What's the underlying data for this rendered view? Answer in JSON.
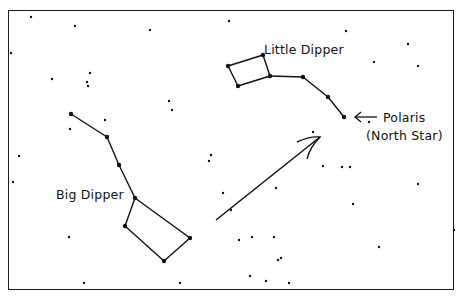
{
  "diagram": {
    "colors": {
      "ink": "#111111",
      "background": "#ffffff"
    },
    "labels": {
      "little_dipper": "Little Dipper",
      "big_dipper": "Big Dipper",
      "polaris": "Polaris",
      "north_star": "(North Star)"
    },
    "big_dipper": {
      "stars": [
        [
          71,
          114
        ],
        [
          107,
          137
        ],
        [
          119,
          165
        ],
        [
          135,
          198
        ],
        [
          125,
          226
        ],
        [
          164,
          261
        ],
        [
          190,
          238
        ]
      ],
      "lines": [
        [
          0,
          1
        ],
        [
          1,
          2
        ],
        [
          2,
          3
        ],
        [
          3,
          4
        ],
        [
          4,
          5
        ],
        [
          5,
          6
        ],
        [
          6,
          3
        ]
      ]
    },
    "little_dipper": {
      "stars": [
        [
          228,
          66
        ],
        [
          263,
          55
        ],
        [
          270,
          76
        ],
        [
          238,
          86
        ],
        [
          303,
          77
        ],
        [
          328,
          97
        ],
        [
          344,
          117
        ]
      ],
      "lines": [
        [
          0,
          1
        ],
        [
          1,
          2
        ],
        [
          2,
          3
        ],
        [
          3,
          0
        ],
        [
          2,
          4
        ],
        [
          4,
          5
        ],
        [
          5,
          6
        ]
      ]
    },
    "pointer_arrow": {
      "from": [
        216,
        220
      ],
      "to": [
        320,
        137
      ]
    },
    "polaris_arrow": {
      "from": [
        377,
        117
      ],
      "to": [
        355,
        117
      ]
    },
    "background_stars": [
      [
        31,
        17
      ],
      [
        75,
        26
      ],
      [
        150,
        30
      ],
      [
        11,
        53
      ],
      [
        52,
        79
      ],
      [
        90,
        73
      ],
      [
        87,
        82
      ],
      [
        88,
        86
      ],
      [
        169,
        101
      ],
      [
        172,
        110
      ],
      [
        105,
        120
      ],
      [
        70,
        129
      ],
      [
        229,
        21
      ],
      [
        346,
        31
      ],
      [
        374,
        62
      ],
      [
        418,
        66
      ],
      [
        408,
        44
      ],
      [
        369,
        122
      ],
      [
        313,
        132
      ],
      [
        323,
        166
      ],
      [
        342,
        167
      ],
      [
        350,
        167
      ],
      [
        13,
        182
      ],
      [
        19,
        156
      ],
      [
        69,
        237
      ],
      [
        84,
        283
      ],
      [
        180,
        283
      ],
      [
        209,
        161
      ],
      [
        211,
        155
      ],
      [
        223,
        193
      ],
      [
        231,
        210
      ],
      [
        239,
        240
      ],
      [
        252,
        237
      ],
      [
        276,
        188
      ],
      [
        274,
        237
      ],
      [
        278,
        260
      ],
      [
        281,
        258
      ],
      [
        250,
        276
      ],
      [
        266,
        281
      ],
      [
        289,
        283
      ],
      [
        353,
        204
      ],
      [
        379,
        247
      ],
      [
        418,
        184
      ],
      [
        454,
        230
      ]
    ]
  }
}
